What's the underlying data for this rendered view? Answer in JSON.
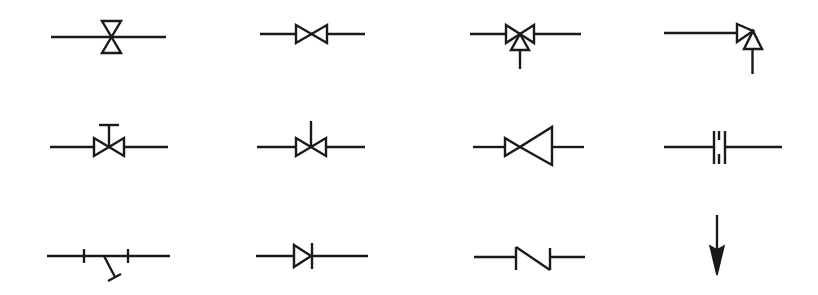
{
  "diagram": {
    "type": "symbol-legend",
    "layout": {
      "rows": 3,
      "columns": 4
    },
    "colors": {
      "stroke": "#1a1a1a",
      "background": "#ffffff"
    },
    "symbols": [
      {
        "row": 1,
        "col": 1,
        "name": "valve-vertical-bowtie-symbol"
      },
      {
        "row": 1,
        "col": 2,
        "name": "gate-valve-symbol"
      },
      {
        "row": 1,
        "col": 3,
        "name": "three-way-valve-symbol"
      },
      {
        "row": 1,
        "col": 4,
        "name": "angle-valve-symbol"
      },
      {
        "row": 2,
        "col": 1,
        "name": "hand-operated-valve-symbol"
      },
      {
        "row": 2,
        "col": 2,
        "name": "stem-valve-symbol"
      },
      {
        "row": 2,
        "col": 3,
        "name": "reducer-valve-symbol"
      },
      {
        "row": 2,
        "col": 4,
        "name": "flange-union-symbol"
      },
      {
        "row": 3,
        "col": 1,
        "name": "spring-safety-valve-symbol"
      },
      {
        "row": 3,
        "col": 2,
        "name": "check-valve-symbol"
      },
      {
        "row": 3,
        "col": 3,
        "name": "non-return-flap-symbol"
      },
      {
        "row": 3,
        "col": 4,
        "name": "flow-direction-arrow-symbol"
      }
    ]
  }
}
